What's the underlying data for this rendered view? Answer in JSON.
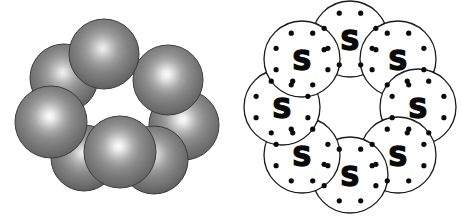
{
  "figure": {
    "background_color": "#ffffff",
    "width": 462,
    "height": 219
  },
  "panels": [
    {
      "id": "space-filling",
      "name": "space-filling-model",
      "caption": "",
      "atom_count": 8,
      "sphere": {
        "element_symbol": "S",
        "radius": 34,
        "highlight_color": "#f5f5f5",
        "mid_color": "#8a8a8a",
        "edge_color": "#4a4a4a",
        "outline_color": "#3d3d3d"
      },
      "atoms": [
        {
          "cx": 104,
          "cy": 54,
          "r": 35,
          "z": 6
        },
        {
          "cx": 64,
          "cy": 78,
          "r": 34,
          "z": 4
        },
        {
          "cx": 168,
          "cy": 80,
          "r": 35,
          "z": 5
        },
        {
          "cx": 51,
          "cy": 122,
          "r": 36,
          "z": 7
        },
        {
          "cx": 184,
          "cy": 125,
          "r": 35,
          "z": 3
        },
        {
          "cx": 84,
          "cy": 158,
          "r": 33,
          "z": 2
        },
        {
          "cx": 154,
          "cy": 160,
          "r": 34,
          "z": 8
        },
        {
          "cx": 120,
          "cy": 152,
          "r": 36,
          "z": 9
        }
      ]
    },
    {
      "id": "lewis",
      "name": "lewis-dot-structure",
      "caption": "",
      "atom_count": 8,
      "ring": {
        "cx": 119,
        "cy": 107,
        "radius": 68
      },
      "circle": {
        "radius": 38,
        "stroke_color": "#1a1a1a",
        "stroke_width": 1.3,
        "fill_color": "#ffffff"
      },
      "dot": {
        "radius": 2.6,
        "color": "#0a0a0a",
        "count_per_atom": 8,
        "orbit_radius": 28
      },
      "atoms": [
        {
          "symbol": "S",
          "cx": 119,
          "cy": 39,
          "angle": -90
        },
        {
          "symbol": "S",
          "cx": 167,
          "cy": 59,
          "angle": -45
        },
        {
          "symbol": "S",
          "cx": 187,
          "cy": 107,
          "angle": 0
        },
        {
          "symbol": "S",
          "cx": 167,
          "cy": 155,
          "angle": 45
        },
        {
          "symbol": "S",
          "cx": 119,
          "cy": 175,
          "angle": 90
        },
        {
          "symbol": "S",
          "cx": 71,
          "cy": 155,
          "angle": 135
        },
        {
          "symbol": "S",
          "cx": 51,
          "cy": 107,
          "angle": 180
        },
        {
          "symbol": "S",
          "cx": 71,
          "cy": 59,
          "angle": -135
        }
      ]
    }
  ],
  "chart_data": {
    "type": "diagram",
    "subtitle": "",
    "molecule": "S8",
    "element_symbol": "S",
    "atoms_in_ring": 8,
    "valence_electrons_per_atom": 8,
    "representations": [
      "space-filling model",
      "Lewis electron-dot structure"
    ],
    "labels": [
      "S",
      "S",
      "S",
      "S",
      "S",
      "S",
      "S",
      "S"
    ],
    "legend": [],
    "annotations": []
  }
}
